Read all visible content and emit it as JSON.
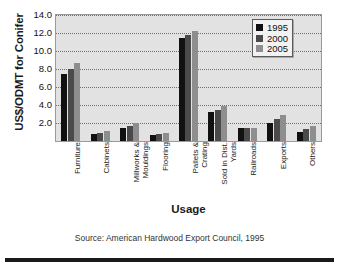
{
  "chart_data": {
    "type": "bar",
    "title": "",
    "xlabel": "Usage",
    "ylabel": "US$/ODMT for Conifer",
    "ylim": [
      0,
      14
    ],
    "yticks": [
      "2.0",
      "4.0",
      "6.0",
      "8.0",
      "10.0",
      "12.0",
      "14.0"
    ],
    "ytick_values": [
      2,
      4,
      6,
      8,
      10,
      12,
      14
    ],
    "grid": true,
    "legend_position": "top-right",
    "categories": [
      "Furniture",
      "Cabinets",
      "Millworks &\nMouldings",
      "Flooring",
      "Pallets &\nCrating",
      "Sold in Dist.\nYards",
      "Railroads",
      "Exports",
      "Others"
    ],
    "series": [
      {
        "name": "1995",
        "color": "#111111",
        "values": [
          7.4,
          0.8,
          1.5,
          0.7,
          11.4,
          3.2,
          1.5,
          2.0,
          1.0
        ]
      },
      {
        "name": "2000",
        "color": "#4a4a4a",
        "values": [
          8.0,
          0.9,
          1.7,
          0.8,
          11.8,
          3.4,
          1.5,
          2.4,
          1.3
        ]
      },
      {
        "name": "2005",
        "color": "#8e8e8e",
        "values": [
          8.7,
          1.1,
          2.0,
          0.9,
          12.2,
          3.9,
          1.5,
          2.9,
          1.7
        ]
      }
    ],
    "source_note": "Source: American Hardwood Export Council, 1995"
  },
  "legend": {
    "items": [
      {
        "label": "1995",
        "color": "#111111"
      },
      {
        "label": "2000",
        "color": "#4a4a4a"
      },
      {
        "label": "2005",
        "color": "#8e8e8e"
      }
    ]
  }
}
